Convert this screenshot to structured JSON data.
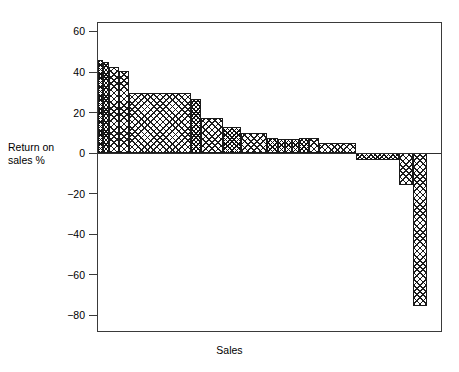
{
  "chart_data": {
    "type": "bar",
    "title": "",
    "subtitle": "",
    "xlabel": "Sales",
    "ylabel": "Return on\nsales %",
    "ylim": [
      -88,
      66
    ],
    "yticks": [
      60,
      40,
      20,
      0,
      -20,
      -40,
      -60,
      -80
    ],
    "ytick_labels": [
      "60",
      "40",
      "20",
      "0",
      "−20",
      "−40",
      "−60",
      "−80"
    ],
    "grid": false,
    "legend": null,
    "chart_style": "variable-width bar chart (Marimekko / ROS-vs-share profitability profile)",
    "x_axis_note": "Bar widths are proportional to sales; bars ordered by descending return on sales",
    "bars": [
      {
        "index": 1,
        "x_start_pct": 0.0,
        "x_end_pct": 1.4,
        "width_pct": 1.4,
        "value": 45.7,
        "fill": "dense"
      },
      {
        "index": 2,
        "x_start_pct": 1.4,
        "x_end_pct": 3.2,
        "width_pct": 1.8,
        "value": 44.7,
        "fill": "dense"
      },
      {
        "index": 3,
        "x_start_pct": 3.2,
        "x_end_pct": 6.1,
        "width_pct": 2.9,
        "value": 42.7,
        "fill": "diamond"
      },
      {
        "index": 4,
        "x_start_pct": 6.1,
        "x_end_pct": 9.0,
        "width_pct": 2.9,
        "value": 40.7,
        "fill": "diamond"
      },
      {
        "index": 5,
        "x_start_pct": 9.0,
        "x_end_pct": 27.0,
        "width_pct": 18.0,
        "value": 29.8,
        "fill": "diamond"
      },
      {
        "index": 6,
        "x_start_pct": 27.0,
        "x_end_pct": 29.9,
        "width_pct": 2.9,
        "value": 26.9,
        "fill": "dense"
      },
      {
        "index": 7,
        "x_start_pct": 29.9,
        "x_end_pct": 36.2,
        "width_pct": 6.3,
        "value": 17.5,
        "fill": "diamond"
      },
      {
        "index": 8,
        "x_start_pct": 36.2,
        "x_end_pct": 41.4,
        "width_pct": 5.2,
        "value": 12.6,
        "fill": "dense"
      },
      {
        "index": 9,
        "x_start_pct": 41.4,
        "x_end_pct": 49.0,
        "width_pct": 7.6,
        "value": 10.1,
        "fill": "diamond"
      },
      {
        "index": 10,
        "x_start_pct": 49.0,
        "x_end_pct": 52.2,
        "width_pct": 3.2,
        "value": 7.2,
        "fill": "dense"
      },
      {
        "index": 11,
        "x_start_pct": 52.2,
        "x_end_pct": 54.2,
        "width_pct": 2.0,
        "value": 7.0,
        "fill": "dense"
      },
      {
        "index": 12,
        "x_start_pct": 54.2,
        "x_end_pct": 56.2,
        "width_pct": 2.0,
        "value": 6.9,
        "fill": "dense"
      },
      {
        "index": 13,
        "x_start_pct": 56.2,
        "x_end_pct": 58.3,
        "width_pct": 2.1,
        "value": 6.8,
        "fill": "dense"
      },
      {
        "index": 14,
        "x_start_pct": 58.3,
        "x_end_pct": 61.2,
        "width_pct": 2.9,
        "value": 7.4,
        "fill": "dense"
      },
      {
        "index": 15,
        "x_start_pct": 61.2,
        "x_end_pct": 64.1,
        "width_pct": 2.9,
        "value": 7.4,
        "fill": "diamond"
      },
      {
        "index": 16,
        "x_start_pct": 64.1,
        "x_end_pct": 74.8,
        "width_pct": 10.7,
        "value": 4.7,
        "fill": "diamond"
      },
      {
        "index": 17,
        "x_start_pct": 74.8,
        "x_end_pct": 87.2,
        "width_pct": 12.4,
        "value": -3.7,
        "fill": "dense"
      },
      {
        "index": 18,
        "x_start_pct": 87.2,
        "x_end_pct": 91.3,
        "width_pct": 4.1,
        "value": -16.0,
        "fill": "diamond"
      },
      {
        "index": 19,
        "x_start_pct": 91.3,
        "x_end_pct": 95.4,
        "width_pct": 4.1,
        "value": -75.8,
        "fill": "diamond"
      }
    ]
  },
  "figure": {
    "background_color": "#ffffff",
    "frame_color": "#3a3a3a",
    "bar_edge_color": "#1a1a1a",
    "bar_fill_color": "#1c1c1c"
  }
}
